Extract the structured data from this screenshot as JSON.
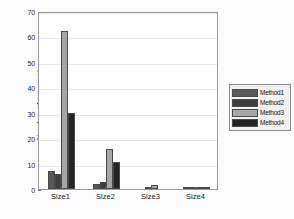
{
  "chart_data": {
    "type": "bar",
    "title": "",
    "subtitle": "",
    "xlabel": "",
    "ylabel": "Number of companies",
    "categories": [
      "Size1",
      "Size2",
      "Size3",
      "Size4"
    ],
    "series": [
      {
        "name": "Method1",
        "color": "#595959",
        "values": [
          7.0,
          1.8,
          0.0,
          0.4
        ]
      },
      {
        "name": "Method2",
        "color": "#3d3d3d",
        "values": [
          6.1,
          2.7,
          0.7,
          0.4
        ]
      },
      {
        "name": "Method3",
        "color": "#a6a6a6",
        "values": [
          62.0,
          15.6,
          1.4,
          0.4
        ]
      },
      {
        "name": "Method4",
        "color": "#242424",
        "values": [
          30.0,
          10.6,
          0.0,
          0.4
        ]
      }
    ],
    "ylim": [
      0,
      70
    ],
    "yticks": [
      0,
      10,
      20,
      30,
      40,
      50,
      60,
      70
    ],
    "ytick_labels": [
      "0",
      "10",
      "20",
      "30",
      "40",
      "50",
      "60",
      "70"
    ],
    "grid": true,
    "legend_position": "right-outside",
    "legend_entries": [
      "Method1",
      "Method2",
      "Method3",
      "Method4"
    ],
    "axes_color": "#9a9a9a",
    "grid_color": "#e8e8e8",
    "background": "#ffffff"
  }
}
